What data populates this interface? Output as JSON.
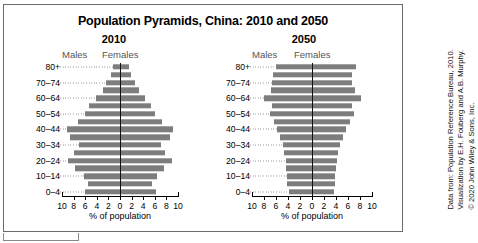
{
  "figure": {
    "title": "Population Pyramids, China: 2010 and 2050",
    "xlabel": "% of population",
    "males_label": "Males",
    "females_label": "Females",
    "bar_color": "#7d7d7d",
    "frame_color": "#6b6b6b"
  },
  "credit": {
    "line1": "Data from: Population Reference Bureau, 2010.",
    "line2": "Visualization by E.H. Fouberg and A.B. Murphy.",
    "line3": "© 2020 John Wiley & Sons, Inc."
  },
  "chart_data": [
    {
      "type": "bar",
      "title": "2010",
      "xlabel": "% of population",
      "ylabel": "",
      "orientation": "horizontal",
      "layout": "population-pyramid",
      "xlim": [
        -10,
        10
      ],
      "xticks": [
        10,
        8,
        6,
        4,
        2,
        0,
        2,
        4,
        6,
        8,
        10
      ],
      "grid": false,
      "legend": [
        "Males",
        "Females"
      ],
      "legend_position": "top",
      "categories": [
        "0–4",
        "5–9",
        "10–14",
        "15–19",
        "20–24",
        "25–29",
        "30–34",
        "35–39",
        "40–44",
        "45–49",
        "50–54",
        "55–59",
        "60–64",
        "65–69",
        "70–74",
        "75–79",
        "80+"
      ],
      "visible_tick_labels": [
        "0–4",
        "10–14",
        "20–24",
        "30–34",
        "40–44",
        "50–54",
        "60–64",
        "70–74",
        "80+"
      ],
      "series": [
        {
          "name": "Males",
          "values": [
            6.1,
            5.6,
            6.2,
            7.8,
            9.0,
            8.0,
            7.1,
            8.6,
            9.2,
            7.3,
            6.0,
            5.3,
            4.2,
            3.0,
            2.4,
            1.6,
            1.2
          ]
        },
        {
          "name": "Females",
          "values": [
            6.2,
            5.6,
            6.3,
            7.6,
            8.9,
            7.8,
            7.0,
            8.6,
            9.1,
            7.2,
            6.1,
            5.4,
            4.3,
            3.2,
            2.6,
            1.9,
            1.6
          ]
        }
      ]
    },
    {
      "type": "bar",
      "title": "2050",
      "xlabel": "% of population",
      "ylabel": "",
      "orientation": "horizontal",
      "layout": "population-pyramid",
      "xlim": [
        -10,
        10
      ],
      "xticks": [
        10,
        8,
        6,
        4,
        2,
        0,
        2,
        4,
        6,
        8,
        10
      ],
      "grid": false,
      "legend": [
        "Males",
        "Females"
      ],
      "legend_position": "top",
      "categories": [
        "0–4",
        "5–9",
        "10–14",
        "15–19",
        "20–24",
        "25–29",
        "30–34",
        "35–39",
        "40–44",
        "45–49",
        "50–54",
        "55–59",
        "60–64",
        "65–69",
        "70–74",
        "75–79",
        "80+"
      ],
      "visible_tick_labels": [
        "0–4",
        "10–14",
        "20–24",
        "30–34",
        "40–44",
        "50–54",
        "60–64",
        "70–74",
        "80+"
      ],
      "series": [
        {
          "name": "Males",
          "values": [
            3.9,
            4.1,
            4.2,
            4.3,
            4.4,
            4.6,
            4.9,
            5.4,
            5.9,
            6.4,
            7.0,
            6.6,
            8.0,
            6.9,
            6.6,
            6.5,
            6.0
          ]
        },
        {
          "name": "Females",
          "values": [
            3.6,
            3.8,
            3.9,
            4.0,
            4.2,
            4.4,
            4.7,
            5.2,
            5.7,
            6.3,
            7.0,
            6.7,
            8.2,
            7.1,
            6.7,
            6.6,
            7.4
          ]
        }
      ]
    }
  ]
}
